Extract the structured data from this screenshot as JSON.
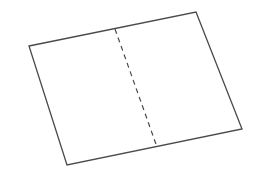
{
  "diagram": {
    "colors": {
      "background": "#ffffff",
      "stroke": "#4a4a4a"
    },
    "sheet": {
      "corners": {
        "top_left": [
          29,
          46
        ],
        "top_right": [
          196,
          12
        ],
        "bottom_right": [
          242,
          129
        ],
        "bottom_left": [
          67,
          165
        ]
      },
      "points": "29,46 196,12 242,129 67,165"
    },
    "fold_line": {
      "style": "dashed",
      "x1": 115,
      "y1": 29,
      "x2": 157,
      "y2": 147,
      "dasharray": "5,4"
    }
  }
}
